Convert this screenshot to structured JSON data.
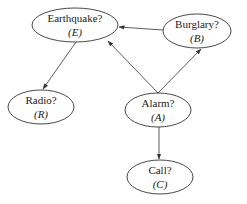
{
  "diagram": {
    "type": "bayesian-network",
    "nodes": [
      {
        "id": "E",
        "label": "Earthquake?",
        "symbol": "(E)",
        "cx": 75,
        "cy": 25,
        "rx": 43,
        "ry": 17
      },
      {
        "id": "B",
        "label": "Burglary?",
        "symbol": "(B)",
        "cx": 197,
        "cy": 31,
        "rx": 34,
        "ry": 17
      },
      {
        "id": "R",
        "label": "Radio?",
        "symbol": "(R)",
        "cx": 41,
        "cy": 107,
        "rx": 33,
        "ry": 17
      },
      {
        "id": "A",
        "label": "Alarm?",
        "symbol": "(A)",
        "cx": 158,
        "cy": 110,
        "rx": 33,
        "ry": 17
      },
      {
        "id": "C",
        "label": "Call?",
        "symbol": "(C)",
        "cx": 160,
        "cy": 177,
        "rx": 33,
        "ry": 17
      }
    ],
    "edges": [
      {
        "from": "B",
        "to": "E"
      },
      {
        "from": "A",
        "to": "E"
      },
      {
        "from": "A",
        "to": "B"
      },
      {
        "from": "E",
        "to": "R"
      },
      {
        "from": "A",
        "to": "C"
      }
    ],
    "colors": {
      "stroke": "#333333",
      "background": "#ffffff",
      "text": "#222222"
    }
  }
}
